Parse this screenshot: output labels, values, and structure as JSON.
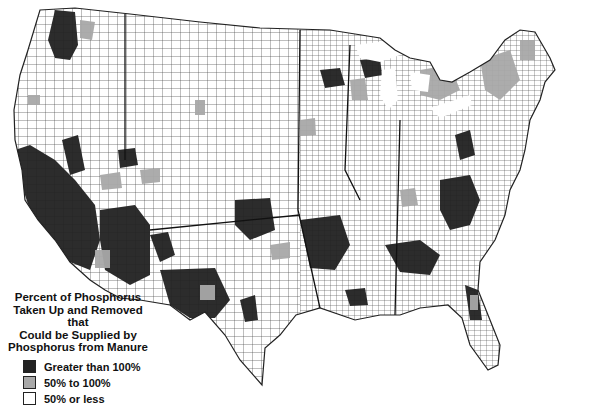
{
  "map": {
    "title": "Percent of Phosphorus Taken Up and Removed that Could be Supplied by Phosphorus from Manure",
    "region": "Contiguous United States (counties)",
    "border_color": "#222222"
  },
  "legend": {
    "title_lines": [
      "Percent of Phosphorus",
      "Taken Up and Removed that",
      "Could be Supplied by",
      "Phosphorus from Manure"
    ],
    "items": [
      {
        "label": "Greater than 100%",
        "color": "#222222"
      },
      {
        "label": "50% to 100%",
        "color": "#a8a8a8"
      },
      {
        "label": "50% or less",
        "color": "#ffffff"
      }
    ]
  }
}
